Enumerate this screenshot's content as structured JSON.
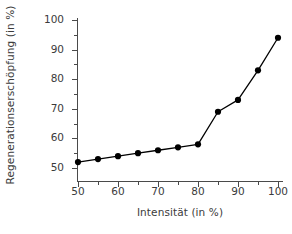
{
  "chart_data": {
    "type": "line",
    "title": "",
    "xlabel": "Intensität (in %)",
    "ylabel": "Regenerationserschöpfung (in %)",
    "xlim": [
      47,
      103
    ],
    "ylim": [
      47,
      101
    ],
    "xticks": [
      50,
      60,
      70,
      80,
      90,
      100
    ],
    "xtick_labels": [
      "50",
      "60",
      "70",
      "80",
      "90",
      "100"
    ],
    "xticks_minor": [
      55,
      65,
      75,
      85,
      95
    ],
    "yticks": [
      50,
      60,
      70,
      80,
      90,
      100
    ],
    "ytick_labels": [
      "50",
      "60",
      "70",
      "80",
      "90",
      "100"
    ],
    "grid": false,
    "legend": false,
    "marker": "circle",
    "marker_color": "#000000",
    "line_color": "#000000",
    "x": [
      50,
      55,
      60,
      65,
      70,
      75,
      80,
      85,
      90,
      95,
      100
    ],
    "values": [
      52,
      53,
      54,
      55,
      56,
      57,
      58,
      69,
      73,
      83,
      94
    ],
    "series": [
      {
        "name": "Regenerationserschöpfung",
        "x": [
          50,
          55,
          60,
          65,
          70,
          75,
          80,
          85,
          90,
          95,
          100
        ],
        "values": [
          52,
          53,
          54,
          55,
          56,
          57,
          58,
          69,
          73,
          83,
          94
        ]
      }
    ]
  },
  "axes": {
    "ylabel": "Regenerationserschöpfung (in %)",
    "xlabel": "Intensität (in %)"
  }
}
